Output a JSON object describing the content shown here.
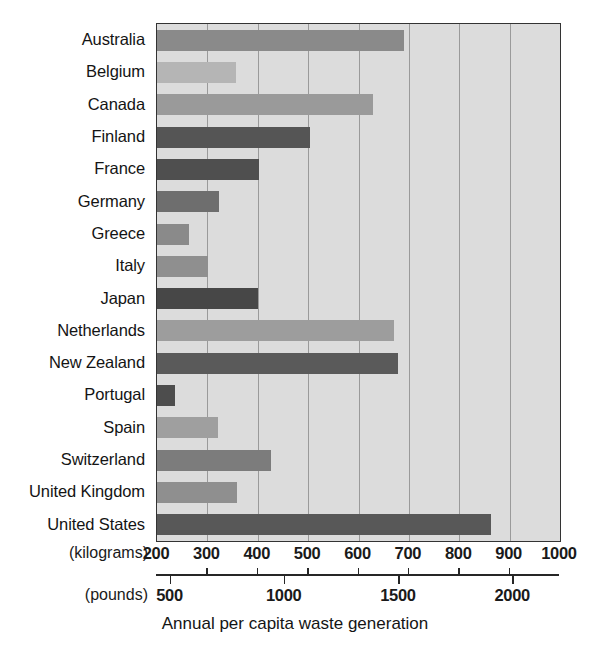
{
  "chart_data": {
    "type": "bar",
    "orientation": "horizontal",
    "title": "",
    "xlabel": "Annual per capita waste generation",
    "ylabel": "",
    "categories": [
      "Australia",
      "Belgium",
      "Canada",
      "Finland",
      "France",
      "Germany",
      "Greece",
      "Italy",
      "Japan",
      "Netherlands",
      "New Zealand",
      "Portugal",
      "Spain",
      "Switzerland",
      "United Kingdom",
      "United States"
    ],
    "values": [
      690,
      357,
      629,
      504,
      402,
      323,
      263,
      301,
      400,
      670,
      678,
      236,
      321,
      426,
      359,
      863
    ],
    "value_unit": "kilograms",
    "bar_colors": [
      "#8a8a8a",
      "#b5b5b5",
      "#9a9a9a",
      "#555555",
      "#4f4f4f",
      "#6e6e6e",
      "#8a8a8a",
      "#8f8f8f",
      "#474747",
      "#9d9d9d",
      "#5a5a5a",
      "#4d4d4d",
      "#9f9f9f",
      "#7c7c7c",
      "#8f8f8f",
      "#585858"
    ],
    "xlim": [
      200,
      1000
    ],
    "grid": true,
    "grid_axis": "x",
    "legend": "none",
    "plot_background": "#dcdcdc",
    "axes": [
      {
        "name": "kilograms",
        "unit_label": "(kilograms)",
        "ticks": [
          200,
          300,
          400,
          500,
          600,
          700,
          800,
          900,
          1000
        ],
        "tick_labels": [
          "200",
          "300",
          "400",
          "500",
          "600",
          "700",
          "800",
          "900",
          "1000"
        ],
        "range": [
          200,
          1000
        ]
      },
      {
        "name": "pounds",
        "unit_label": "(pounds)",
        "ticks": [
          500,
          1000,
          1500,
          2000
        ],
        "tick_labels": [
          "500",
          "1000",
          "1500",
          "2000"
        ],
        "ticks_in_kg": [
          226.8,
          453.6,
          680.4,
          907.2
        ],
        "range_kg": [
          200,
          1000
        ]
      }
    ]
  },
  "caption": "Annual per capita waste generation"
}
